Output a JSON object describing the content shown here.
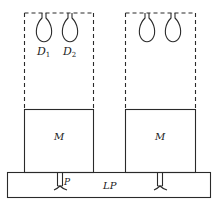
{
  "diagram": {
    "labels": {
      "drop1": "D",
      "drop1_sub": "1",
      "drop2": "D",
      "drop2_sub": "2",
      "mass_left": "M",
      "mass_right": "M",
      "peg": "P",
      "base": "LP"
    },
    "colors": {
      "stroke": "#2a2a2a",
      "background": "#ffffff"
    }
  }
}
